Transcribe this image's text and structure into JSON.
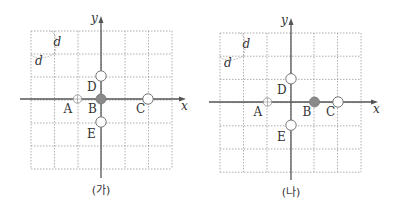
{
  "figure": {
    "grid": {
      "columns": 6,
      "rows": 6,
      "cell_label": "d",
      "line_style": "dashed",
      "line_color": "#9a9a9a"
    },
    "axes": {
      "x_label": "x",
      "y_label": "y",
      "color": "#555555"
    },
    "marker_colors": {
      "filled": "#8a8a8a",
      "open": "#ffffff",
      "outline": "#777777"
    },
    "panels": [
      {
        "id": "ga",
        "caption": "(가)",
        "points": [
          {
            "label": "A",
            "x": -1,
            "y": 0,
            "style": "cross"
          },
          {
            "label": "B",
            "x": 0,
            "y": 0,
            "style": "filled"
          },
          {
            "label": "C",
            "x": 2,
            "y": 0,
            "style": "open"
          },
          {
            "label": "D",
            "x": 0,
            "y": 1,
            "style": "open"
          },
          {
            "label": "E",
            "x": 0,
            "y": -1,
            "style": "open"
          }
        ]
      },
      {
        "id": "na",
        "caption": "(나)",
        "points": [
          {
            "label": "A",
            "x": -1,
            "y": 0,
            "style": "cross"
          },
          {
            "label": "B",
            "x": 1,
            "y": 0,
            "style": "filled"
          },
          {
            "label": "C",
            "x": 2,
            "y": 0,
            "style": "open"
          },
          {
            "label": "D",
            "x": 0,
            "y": 1,
            "style": "open"
          },
          {
            "label": "E",
            "x": 0,
            "y": -1,
            "style": "open"
          }
        ]
      }
    ]
  }
}
